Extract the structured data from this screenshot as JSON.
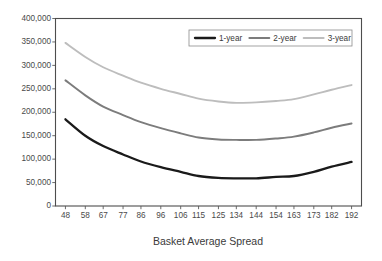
{
  "chart_data": {
    "type": "line",
    "title": "",
    "xlabel": "Basket Average Spread",
    "ylabel": "",
    "x": [
      48,
      58,
      67,
      77,
      86,
      96,
      106,
      115,
      125,
      134,
      144,
      154,
      163,
      173,
      182,
      192
    ],
    "xtick_labels": [
      "48",
      "58",
      "67",
      "77",
      "86",
      "96",
      "106",
      "115",
      "125",
      "134",
      "144",
      "154",
      "163",
      "173",
      "182",
      "192"
    ],
    "ytick_labels": [
      "0",
      "50,000",
      "100,000",
      "150,000",
      "200,000",
      "250,000",
      "300,000",
      "350,000",
      "400,000"
    ],
    "ytick_values": [
      0,
      50000,
      100000,
      150000,
      200000,
      250000,
      300000,
      350000,
      400000
    ],
    "ylim": [
      0,
      400000
    ],
    "xlim": [
      43,
      197
    ],
    "grid": false,
    "legend_position": "top-right",
    "series": [
      {
        "name": "1-year",
        "color": "#1a1a1a",
        "width": 2.3,
        "values": [
          185000,
          150000,
          128000,
          110000,
          95000,
          83000,
          73000,
          64000,
          60000,
          59000,
          59000,
          62000,
          64000,
          73000,
          84000,
          94000
        ]
      },
      {
        "name": "2-year",
        "color": "#7c7c7c",
        "width": 1.9,
        "values": [
          268000,
          236000,
          212000,
          194000,
          179000,
          166000,
          155000,
          146000,
          142000,
          141000,
          141000,
          144000,
          148000,
          157000,
          167000,
          176000
        ]
      },
      {
        "name": "3-year",
        "color": "#bdbdbd",
        "width": 1.9,
        "values": [
          348000,
          318000,
          296000,
          278000,
          263000,
          250000,
          239000,
          229000,
          223000,
          220000,
          221000,
          224000,
          228000,
          238000,
          248000,
          258000
        ]
      }
    ]
  },
  "legend": {
    "items": [
      {
        "label": "1-year"
      },
      {
        "label": "2-year"
      },
      {
        "label": "3-year"
      }
    ]
  },
  "axis": {
    "x_title": "Basket Average Spread"
  }
}
